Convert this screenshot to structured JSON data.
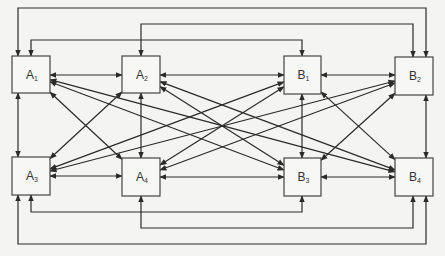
{
  "diagram": {
    "type": "directed-graph",
    "nodes": [
      {
        "id": "A1",
        "label": "A",
        "sub": "1",
        "x": 12,
        "y": 56,
        "w": 38,
        "h": 37
      },
      {
        "id": "A2",
        "label": "A",
        "sub": "2",
        "x": 122,
        "y": 56,
        "w": 38,
        "h": 37
      },
      {
        "id": "B1",
        "label": "B",
        "sub": "1",
        "x": 284,
        "y": 56,
        "w": 37,
        "h": 38
      },
      {
        "id": "B2",
        "label": "B",
        "sub": "2",
        "x": 395,
        "y": 57,
        "w": 38,
        "h": 38
      },
      {
        "id": "A3",
        "label": "A",
        "sub": "3",
        "x": 12,
        "y": 157,
        "w": 38,
        "h": 38
      },
      {
        "id": "A4",
        "label": "A",
        "sub": "4",
        "x": 122,
        "y": 158,
        "w": 38,
        "h": 38
      },
      {
        "id": "B3",
        "label": "B",
        "sub": "3",
        "x": 284,
        "y": 158,
        "w": 37,
        "h": 38
      },
      {
        "id": "B4",
        "label": "B",
        "sub": "4",
        "x": 395,
        "y": 158,
        "w": 38,
        "h": 38
      }
    ],
    "edges": [
      {
        "from": "A1",
        "to": "A2",
        "bidirectional": true
      },
      {
        "from": "A2",
        "to": "B1",
        "bidirectional": true
      },
      {
        "from": "B1",
        "to": "B2",
        "bidirectional": true
      },
      {
        "from": "A3",
        "to": "A4",
        "bidirectional": true
      },
      {
        "from": "A4",
        "to": "B3",
        "bidirectional": true
      },
      {
        "from": "B3",
        "to": "B4",
        "bidirectional": true
      },
      {
        "from": "A1",
        "to": "A3",
        "bidirectional": true
      },
      {
        "from": "A2",
        "to": "A4",
        "bidirectional": true
      },
      {
        "from": "B1",
        "to": "B3",
        "bidirectional": true
      },
      {
        "from": "B2",
        "to": "B4",
        "bidirectional": true
      },
      {
        "from": "A1",
        "to": "A4",
        "bidirectional": true
      },
      {
        "from": "A2",
        "to": "A3",
        "bidirectional": true
      },
      {
        "from": "A1",
        "to": "B3",
        "bidirectional": true
      },
      {
        "from": "A1",
        "to": "B4",
        "bidirectional": true
      },
      {
        "from": "A2",
        "to": "B3",
        "bidirectional": true
      },
      {
        "from": "A2",
        "to": "B4",
        "bidirectional": true
      },
      {
        "from": "A3",
        "to": "B1",
        "bidirectional": true
      },
      {
        "from": "A3",
        "to": "B2",
        "bidirectional": true
      },
      {
        "from": "A4",
        "to": "B1",
        "bidirectional": true
      },
      {
        "from": "A4",
        "to": "B2",
        "bidirectional": true
      },
      {
        "from": "B1",
        "to": "B4",
        "bidirectional": true
      },
      {
        "from": "B2",
        "to": "B3",
        "bidirectional": true
      },
      {
        "from": "A1",
        "to": "B2",
        "bidirectional": true,
        "route": "top-outer"
      },
      {
        "from": "A2",
        "to": "B2",
        "bidirectional": true,
        "route": "top-middle"
      },
      {
        "from": "A1",
        "to": "B1",
        "bidirectional": true,
        "route": "top-inner"
      },
      {
        "from": "A3",
        "to": "B3",
        "bidirectional": true,
        "route": "bottom-inner"
      },
      {
        "from": "A4",
        "to": "B4",
        "bidirectional": true,
        "route": "bottom-middle"
      },
      {
        "from": "A3",
        "to": "B4",
        "bidirectional": true,
        "route": "bottom-outer"
      }
    ],
    "colors": {
      "line": "#2a2a2a",
      "box_fill": "#f7f7f5",
      "box_stroke": "#444444",
      "background": "#f4f4f2"
    }
  }
}
